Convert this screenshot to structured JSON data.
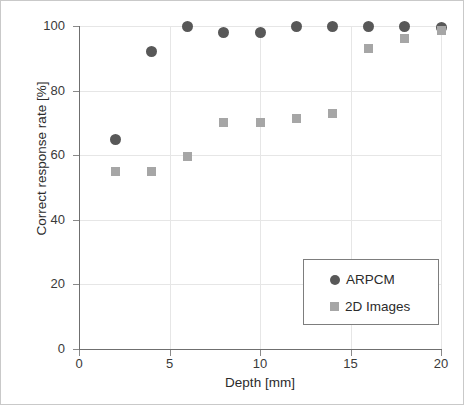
{
  "chart_data": {
    "type": "scatter",
    "title": "",
    "xlabel": "Depth [mm]",
    "ylabel": "Correct response rate  [%]",
    "xlim": [
      0,
      20
    ],
    "ylim": [
      0,
      100
    ],
    "xticks": [
      0,
      5,
      10,
      15,
      20
    ],
    "xtick_labels": [
      "0",
      "5",
      "10",
      "15",
      "20"
    ],
    "yticks": [
      0,
      20,
      40,
      60,
      80,
      100
    ],
    "ytick_labels": [
      "0",
      "20",
      "40",
      "60",
      "80",
      "100"
    ],
    "grid": true,
    "legend_position": "lower right",
    "x": [
      2,
      4,
      6,
      8,
      10,
      12,
      14,
      16,
      18,
      20
    ],
    "series": [
      {
        "name": "ARPCM",
        "marker": "circle",
        "color": "#585858",
        "values": [
          65,
          92,
          100,
          98,
          98,
          100,
          100,
          100,
          100,
          99.5
        ]
      },
      {
        "name": "2D Images",
        "marker": "square",
        "color": "#a6a6a6",
        "values": [
          55,
          55,
          59.5,
          70,
          70,
          71.5,
          73,
          93,
          96,
          98.5
        ]
      }
    ]
  },
  "legend": {
    "items": [
      {
        "label": "ARPCM",
        "marker": "circle"
      },
      {
        "label": "2D Images",
        "marker": "square"
      }
    ]
  }
}
